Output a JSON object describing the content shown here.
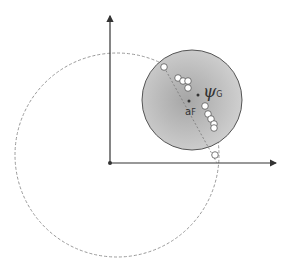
{
  "diagram": {
    "axes": {
      "origin": [
        110,
        163
      ],
      "y_axis_top": [
        110,
        14
      ],
      "x_axis_right": [
        278,
        163
      ],
      "color": "#333333"
    },
    "gray_circle": {
      "center": [
        192,
        100
      ],
      "radius": 50,
      "fill_center": "#a8a8a8",
      "fill_edge": "#cdcdcd",
      "stroke": "#555555"
    },
    "dashed_circle": {
      "center": [
        117,
        155
      ],
      "radius": 102,
      "stroke": "#999999"
    },
    "dashed_line": {
      "from": [
        164,
        67
      ],
      "to": [
        217,
        163
      ]
    },
    "points": {
      "psi_center": [
        198,
        95
      ],
      "a_f": [
        189,
        101
      ]
    },
    "white_circles": [
      [
        164,
        67
      ],
      [
        178,
        78
      ],
      [
        183,
        81
      ],
      [
        188,
        81
      ],
      [
        188,
        88
      ],
      [
        205,
        106
      ],
      [
        208,
        114
      ],
      [
        211,
        119
      ],
      [
        214,
        124
      ],
      [
        214,
        128
      ],
      [
        215,
        155
      ]
    ],
    "labels": {
      "psi_symbol": "ψ",
      "psi_subscript": "G",
      "af_main": "a",
      "af_subscript": "F"
    }
  }
}
